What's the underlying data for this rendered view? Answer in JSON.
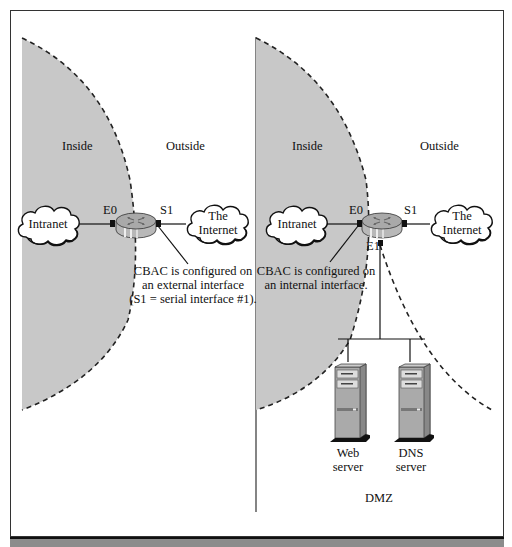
{
  "left_panel": {
    "zone_inside": "Inside",
    "zone_outside": "Outside",
    "intranet_cloud": "Intranet",
    "internet_cloud_line1": "The",
    "internet_cloud_line2": "Internet",
    "iface_e0": "E0",
    "iface_s1": "S1",
    "note_line1": "CBAC is configured on",
    "note_line2": "an external interface",
    "note_line3": "(S1 = serial interface #1)."
  },
  "right_panel": {
    "zone_inside": "Inside",
    "zone_outside": "Outside",
    "intranet_cloud": "Intranet",
    "internet_cloud_line1": "The",
    "internet_cloud_line2": "Internet",
    "iface_e0": "E0",
    "iface_s1": "S1",
    "iface_e1": "E1",
    "note_line1": "CBAC is configured on",
    "note_line2": "an internal interface.",
    "servers": [
      {
        "line1": "Web",
        "line2": "server"
      },
      {
        "line1": "DNS",
        "line2": "server"
      }
    ],
    "zone_dmz": "DMZ"
  },
  "colors": {
    "inside_fill": "#c8c8c8",
    "border": "#333333",
    "footer": "#8c8c8c"
  }
}
